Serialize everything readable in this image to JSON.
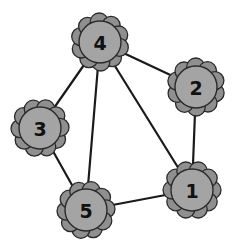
{
  "diagram": {
    "type": "undirected-graph",
    "nodes": [
      {
        "id": "1",
        "label": "1"
      },
      {
        "id": "2",
        "label": "2"
      },
      {
        "id": "3",
        "label": "3"
      },
      {
        "id": "4",
        "label": "4"
      },
      {
        "id": "5",
        "label": "5"
      }
    ],
    "edges": [
      {
        "from": "4",
        "to": "2"
      },
      {
        "from": "4",
        "to": "3"
      },
      {
        "from": "4",
        "to": "5"
      },
      {
        "from": "4",
        "to": "1"
      },
      {
        "from": "2",
        "to": "1"
      },
      {
        "from": "3",
        "to": "5"
      },
      {
        "from": "5",
        "to": "1"
      }
    ],
    "colors": {
      "node_fill": "#a4a4a4",
      "petal_fill": "#8f8f8f",
      "outline": "#2a2a2a",
      "edge": "#1a1a1a",
      "background": "#ffffff"
    }
  }
}
